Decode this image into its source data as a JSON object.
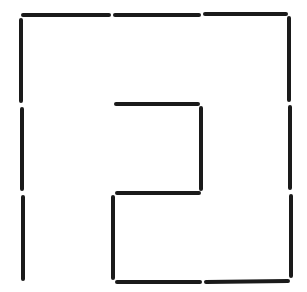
{
  "diagram": {
    "title": "",
    "type": "matchstick-puzzle",
    "stroke_color": "#1a1a1a",
    "background_color": "#ffffff",
    "stroke_width": 4,
    "matchsticks": [
      {
        "id": "top-1",
        "x1": 23,
        "y1": 15,
        "x2": 109,
        "y2": 15
      },
      {
        "id": "top-2",
        "x1": 115,
        "y1": 15,
        "x2": 199,
        "y2": 15
      },
      {
        "id": "top-3",
        "x1": 205,
        "y1": 14,
        "x2": 286,
        "y2": 14
      },
      {
        "id": "left-1",
        "x1": 21,
        "y1": 20,
        "x2": 21,
        "y2": 101
      },
      {
        "id": "left-2",
        "x1": 22,
        "y1": 109,
        "x2": 22,
        "y2": 189
      },
      {
        "id": "left-3",
        "x1": 23,
        "y1": 197,
        "x2": 23,
        "y2": 279
      },
      {
        "id": "right-1",
        "x1": 289,
        "y1": 18,
        "x2": 289,
        "y2": 100
      },
      {
        "id": "right-2",
        "x1": 290,
        "y1": 107,
        "x2": 290,
        "y2": 188
      },
      {
        "id": "right-3",
        "x1": 291,
        "y1": 196,
        "x2": 291,
        "y2": 276
      },
      {
        "id": "inner-top",
        "x1": 116,
        "y1": 104,
        "x2": 198,
        "y2": 104
      },
      {
        "id": "inner-right",
        "x1": 201,
        "y1": 108,
        "x2": 201,
        "y2": 189
      },
      {
        "id": "inner-middle",
        "x1": 117,
        "y1": 193,
        "x2": 199,
        "y2": 193
      },
      {
        "id": "inner-left",
        "x1": 113,
        "y1": 197,
        "x2": 113,
        "y2": 278
      },
      {
        "id": "bottom-1",
        "x1": 117,
        "y1": 282,
        "x2": 200,
        "y2": 282
      },
      {
        "id": "bottom-2",
        "x1": 206,
        "y1": 282,
        "x2": 288,
        "y2": 281
      }
    ]
  }
}
